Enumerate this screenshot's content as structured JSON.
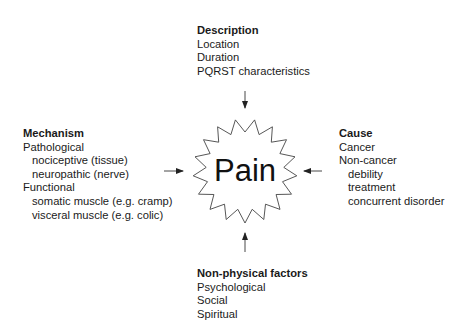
{
  "center": {
    "label": "Pain",
    "shape": "starburst",
    "points": 17
  },
  "description": {
    "heading": "Description",
    "items": [
      "Location",
      "Duration",
      "PQRST characteristics"
    ]
  },
  "mechanism": {
    "heading": "Mechanism",
    "groups": [
      {
        "label": "Pathological",
        "subitems": [
          "nociceptive (tissue)",
          "neuropathic (nerve)"
        ]
      },
      {
        "label": "Functional",
        "subitems": [
          "somatic muscle (e.g. cramp)",
          "visceral muscle (e.g. colic)"
        ]
      }
    ]
  },
  "cause": {
    "heading": "Cause",
    "items": [
      "Cancer",
      "Non-cancer"
    ],
    "subitems": [
      "debility",
      "treatment",
      "concurrent disorder"
    ]
  },
  "nonphysical": {
    "heading": "Non-physical factors",
    "items": [
      "Psychological",
      "Social",
      "Spiritual"
    ]
  },
  "arrows": [
    {
      "from": "description",
      "to": "center",
      "direction": "down"
    },
    {
      "from": "mechanism",
      "to": "center",
      "direction": "right"
    },
    {
      "from": "cause",
      "to": "center",
      "direction": "left"
    },
    {
      "from": "nonphysical",
      "to": "center",
      "direction": "up"
    }
  ],
  "colors": {
    "line": "#333333",
    "text": "#1a1a1a",
    "background": "#ffffff"
  }
}
